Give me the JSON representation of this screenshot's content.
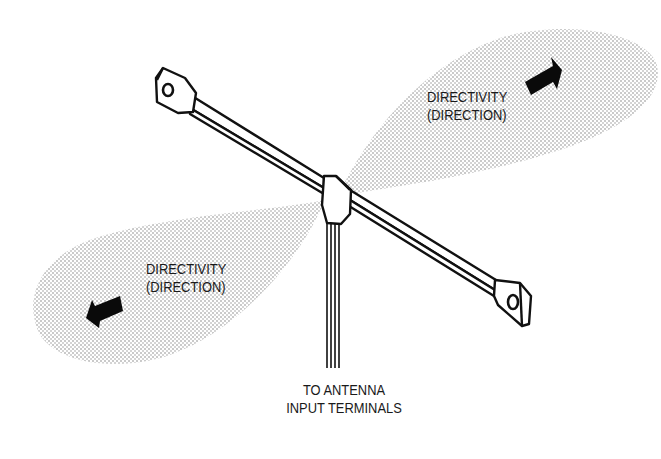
{
  "figure": {
    "labels": {
      "upper_lobe": {
        "line1": "DIRECTIVITY",
        "line2": "(DIRECTION)"
      },
      "lower_lobe": {
        "line1": "DIRECTIVITY",
        "line2": "(DIRECTION)"
      },
      "lead_in": {
        "line1": "TO ANTENNA",
        "line2": "INPUT TERMINALS"
      }
    },
    "colors": {
      "ink": "#111111",
      "stipple": "#9a9a9a",
      "background": "#ffffff"
    }
  }
}
